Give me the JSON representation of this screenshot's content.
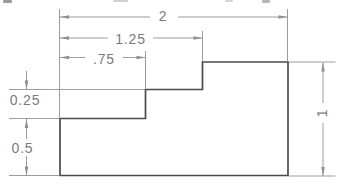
{
  "drawing": {
    "kind": "stepped-block-technical-drawing",
    "dims": {
      "overall_width": "2",
      "upper_step_width": "1.25",
      "lower_step_width": ".75",
      "step_height": "0.25",
      "base_height": "0.5",
      "overall_height": "1"
    },
    "geometry_units": {
      "profile_points": [
        [
          0,
          0
        ],
        [
          2,
          0
        ],
        [
          2,
          1
        ],
        [
          1.25,
          1
        ],
        [
          1.25,
          0.75
        ],
        [
          0.75,
          0.75
        ],
        [
          0.75,
          0.5
        ],
        [
          0,
          0.5
        ]
      ]
    },
    "colors": {
      "object_line": "#4b4b4b",
      "dimension_line": "#9c9c9c",
      "arrowhead": "#8f8f8f",
      "dimension_text": "#7b7b7b",
      "background": "#ffffff"
    }
  }
}
